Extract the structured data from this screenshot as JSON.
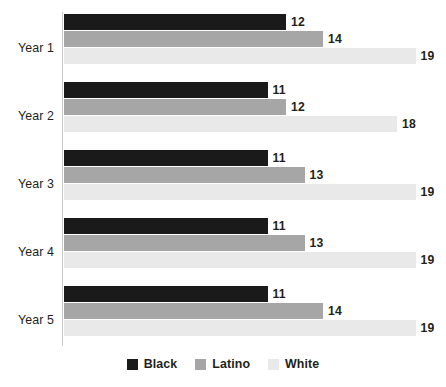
{
  "chart_data": {
    "type": "bar",
    "orientation": "horizontal",
    "title": "",
    "subtitle": "",
    "xlabel": "",
    "ylabel": "",
    "grid": false,
    "legend_position": "bottom",
    "xlim": [
      0,
      19
    ],
    "categories": [
      "Year 1",
      "Year 2",
      "Year 3",
      "Year 4",
      "Year 5"
    ],
    "series": [
      {
        "name": "Black",
        "color": "#1a1a1a",
        "values": [
          12,
          11,
          11,
          11,
          11
        ]
      },
      {
        "name": "Latino",
        "color": "#a6a6a6",
        "values": [
          14,
          12,
          13,
          13,
          14
        ]
      },
      {
        "name": "White",
        "color": "#e9e9e9",
        "values": [
          19,
          18,
          19,
          19,
          19
        ]
      }
    ],
    "groups": [
      {
        "category": "Year 1",
        "bars": [
          {
            "series": "Black",
            "value": 12,
            "label": "12",
            "color": "#1a1a1a"
          },
          {
            "series": "Latino",
            "value": 14,
            "label": "14",
            "color": "#a6a6a6"
          },
          {
            "series": "White",
            "value": 19,
            "label": "19",
            "color": "#e9e9e9"
          }
        ]
      },
      {
        "category": "Year 2",
        "bars": [
          {
            "series": "Black",
            "value": 11,
            "label": "11",
            "color": "#1a1a1a"
          },
          {
            "series": "Latino",
            "value": 12,
            "label": "12",
            "color": "#a6a6a6"
          },
          {
            "series": "White",
            "value": 18,
            "label": "18",
            "color": "#e9e9e9"
          }
        ]
      },
      {
        "category": "Year 3",
        "bars": [
          {
            "series": "Black",
            "value": 11,
            "label": "11",
            "color": "#1a1a1a"
          },
          {
            "series": "Latino",
            "value": 13,
            "label": "13",
            "color": "#a6a6a6"
          },
          {
            "series": "White",
            "value": 19,
            "label": "19",
            "color": "#e9e9e9"
          }
        ]
      },
      {
        "category": "Year 4",
        "bars": [
          {
            "series": "Black",
            "value": 11,
            "label": "11",
            "color": "#1a1a1a"
          },
          {
            "series": "Latino",
            "value": 13,
            "label": "13",
            "color": "#a6a6a6"
          },
          {
            "series": "White",
            "value": 19,
            "label": "19",
            "color": "#e9e9e9"
          }
        ]
      },
      {
        "category": "Year 5",
        "bars": [
          {
            "series": "Black",
            "value": 11,
            "label": "11",
            "color": "#1a1a1a"
          },
          {
            "series": "Latino",
            "value": 14,
            "label": "14",
            "color": "#a6a6a6"
          },
          {
            "series": "White",
            "value": 19,
            "label": "19",
            "color": "#e9e9e9"
          }
        ]
      }
    ],
    "legend": [
      {
        "label": "Black",
        "color": "#1a1a1a"
      },
      {
        "label": "Latino",
        "color": "#a6a6a6"
      },
      {
        "label": "White",
        "color": "#e9e9e9"
      }
    ]
  },
  "layout": {
    "axis_color": "#c9c9c9",
    "background": "#ffffff",
    "px_per_unit": 18.5,
    "plot_left": 64,
    "plot_top": 14,
    "bar_height": 16,
    "group_pitch": 68
  }
}
